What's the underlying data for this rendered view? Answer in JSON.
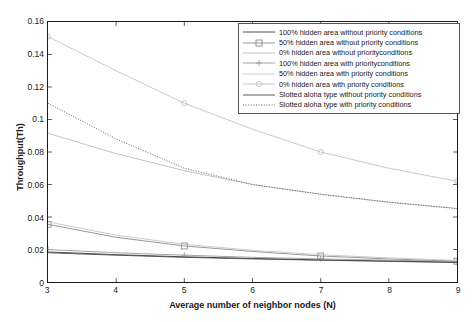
{
  "chart_data": {
    "type": "line",
    "title": "",
    "xlabel": "Average number of neighbor nodes (N)",
    "ylabel": "Throughput(Th)",
    "xlim": [
      3,
      9
    ],
    "ylim": [
      0,
      0.16
    ],
    "xticks": [
      "3",
      "4",
      "5",
      "6",
      "7",
      "8",
      "9"
    ],
    "yticks": [
      "0",
      "0.02",
      "0.04",
      "0.06",
      "0.08",
      "0.1",
      "0.12",
      "0.14",
      "0.16"
    ],
    "grid": false,
    "legend_position": "upper-right",
    "x": [
      3,
      4,
      5,
      6,
      7,
      8,
      9
    ],
    "series": [
      {
        "name": "100% hidden area without priority conditions",
        "values": [
          0.0185,
          0.0168,
          0.0155,
          0.0145,
          0.0136,
          0.0129,
          0.0122
        ],
        "style": "solid",
        "marker": "none",
        "color": "#3a3a3a"
      },
      {
        "name": "50% hidden area without priority conditions",
        "values": [
          0.0355,
          0.0275,
          0.0222,
          0.0188,
          0.016,
          0.0142,
          0.0128
        ],
        "style": "solid",
        "marker": "square",
        "color": "#8a8a8a"
      },
      {
        "name": "0% hidden area without priorityconditions",
        "values": [
          0.0915,
          0.079,
          0.0685,
          0.06,
          0.054,
          0.049,
          0.0452
        ],
        "style": "solid",
        "marker": "none",
        "color": "#bcbcbc"
      },
      {
        "name": "100% hidden area with priorityconditions",
        "values": [
          0.02,
          0.018,
          0.0165,
          0.0152,
          0.0142,
          0.0134,
          0.0127
        ],
        "style": "solid",
        "marker": "plus",
        "color": "#9a9a9a"
      },
      {
        "name": "50% hidden area with priority conditions",
        "values": [
          0.037,
          0.0288,
          0.0232,
          0.0195,
          0.0168,
          0.0148,
          0.0133
        ],
        "style": "solid",
        "marker": "none",
        "color": "#c6c6c6"
      },
      {
        "name": "0% hidden area with priority conditions",
        "values": [
          0.151,
          0.13,
          0.11,
          0.094,
          0.08,
          0.07,
          0.062
        ],
        "style": "solid",
        "marker": "circle",
        "color": "#c2c2c2"
      },
      {
        "name": "Slotted aloha type without priority conditions",
        "values": [
          0.018,
          0.0165,
          0.0152,
          0.0142,
          0.0134,
          0.0127,
          0.012
        ],
        "style": "solid",
        "marker": "none",
        "color": "#4a4a4a"
      },
      {
        "name": "Slotted aloha type with priority conditions",
        "values": [
          0.11,
          0.088,
          0.07,
          0.06,
          0.054,
          0.0492,
          0.0452
        ],
        "style": "dotted",
        "marker": "none",
        "color": "#555555"
      }
    ]
  },
  "axes": {
    "ylabel": "Throughput(Th)",
    "xlabel": "Average number of neighbor nodes (N)"
  },
  "legend": {
    "items": [
      {
        "label": "100% hidden area without priority conditions",
        "marker": "none",
        "style": "solid"
      },
      {
        "label": "50% hidden area without priority conditions",
        "marker": "square",
        "style": "solid"
      },
      {
        "label": "0% hidden area without priorityconditions",
        "marker": "none",
        "style": "solid"
      },
      {
        "label": "100% hidden area with priorityconditions",
        "marker": "plus",
        "style": "solid"
      },
      {
        "label": "50% hidden area with priority conditions",
        "marker": "none",
        "style": "solid"
      },
      {
        "label": "0% hidden area with priority conditions",
        "marker": "circle",
        "style": "solid"
      },
      {
        "label": "Slotted aloha type without priority conditions",
        "marker": "none",
        "style": "solid"
      },
      {
        "label": "Slotted aloha type with priority conditions",
        "marker": "none",
        "style": "dotted"
      }
    ]
  }
}
